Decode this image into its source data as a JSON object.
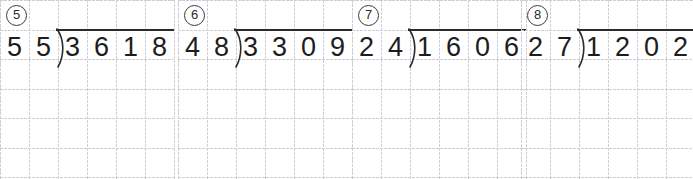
{
  "worksheet": {
    "title": "Long division practice problems",
    "grid_color": "#d5d5da",
    "ink_color": "#1d1d1d",
    "panel_count": 4
  },
  "problems": [
    {
      "index_label": "⑤",
      "index_number": "5",
      "divisor": "55",
      "dividend": "3618",
      "divisor_digits": [
        "5",
        "5"
      ],
      "dividend_digits": [
        "3",
        "6",
        "1",
        "8"
      ],
      "operator": "division-bracket",
      "expression": "3618 ÷ 55"
    },
    {
      "index_label": "⑥",
      "index_number": "6",
      "divisor": "48",
      "dividend": "3309",
      "divisor_digits": [
        "4",
        "8"
      ],
      "dividend_digits": [
        "3",
        "3",
        "0",
        "9"
      ],
      "operator": "division-bracket",
      "expression": "3309 ÷ 48"
    },
    {
      "index_label": "⑦",
      "index_number": "7",
      "divisor": "24",
      "dividend": "1606",
      "divisor_digits": [
        "2",
        "4"
      ],
      "dividend_digits": [
        "1",
        "6",
        "0",
        "6"
      ],
      "operator": "division-bracket",
      "expression": "1606 ÷ 24"
    },
    {
      "index_label": "⑧",
      "index_number": "8",
      "divisor": "27",
      "dividend": "1202",
      "divisor_digits": [
        "2",
        "7"
      ],
      "dividend_digits": [
        "1",
        "2",
        "0",
        "2"
      ],
      "operator": "division-bracket",
      "expression": "1202 ÷ 27"
    }
  ]
}
